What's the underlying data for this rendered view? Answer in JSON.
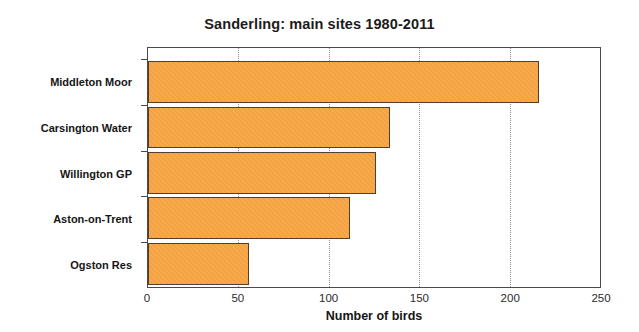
{
  "chart_data": {
    "type": "bar",
    "orientation": "horizontal",
    "title": "Sanderling: main sites 1980-2011",
    "xlabel": "Number of birds",
    "ylabel": "",
    "categories": [
      "Middleton Moor",
      "Carsington Water",
      "Willington GP",
      "Aston-on-Trent",
      "Ogston Res"
    ],
    "values": [
      216,
      134,
      126,
      112,
      56
    ],
    "xlim": [
      0,
      250
    ],
    "xticks": [
      0,
      50,
      100,
      150,
      200,
      250
    ],
    "xtick_labels": [
      "0",
      "50",
      "100",
      "150",
      "200",
      "250"
    ],
    "grid": "vertical-dotted",
    "legend": "none",
    "colors": {
      "bar_fill": "#f5a03c",
      "bar_edge": "#53402c",
      "axis": "#4a4a4a",
      "gridline": "#8e8e8e",
      "text": "#151515",
      "background": "#ffffff"
    }
  }
}
